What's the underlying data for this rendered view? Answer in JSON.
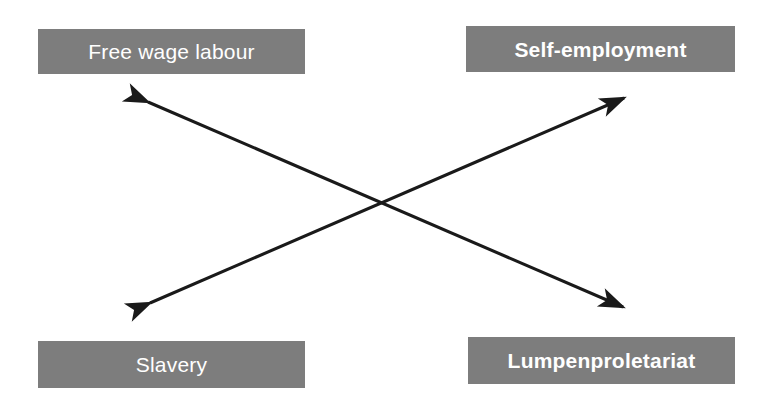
{
  "diagram": {
    "type": "two-axis-crossing-arrows",
    "background_color": "#ffffff",
    "box_fill_color": "#7d7d7d",
    "box_text_color": "#ffffff",
    "arrow_color": "#1a1a1a",
    "nodes": [
      {
        "id": "free-wage-labour",
        "label": "Free wage labour",
        "position": "top-left",
        "bold": false
      },
      {
        "id": "self-employment",
        "label": "Self-employment",
        "position": "top-right",
        "bold": true
      },
      {
        "id": "slavery",
        "label": "Slavery",
        "position": "bottom-left",
        "bold": false
      },
      {
        "id": "lumpenproletariat",
        "label": "Lumpenproletariat",
        "position": "bottom-right",
        "bold": true
      }
    ],
    "connectors": [
      {
        "id": "free-wage-labour-to-lumpenproletariat",
        "from": "free-wage-labour",
        "to": "lumpenproletariat",
        "style": "double-headed-arrow"
      },
      {
        "id": "slavery-to-self-employment",
        "from": "slavery",
        "to": "self-employment",
        "style": "double-headed-arrow"
      }
    ],
    "crossing_point": "386,203"
  }
}
